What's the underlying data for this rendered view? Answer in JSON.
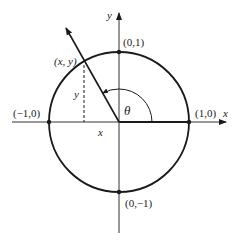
{
  "diagram": {
    "type": "unit-circle",
    "axes": {
      "x_label": "x",
      "y_label": "y"
    },
    "points": {
      "top": "(0,1)",
      "bottom": "(0,−1)",
      "left": "(−1,0)",
      "right": "(1,0)",
      "on_circle": "(x, y)"
    },
    "angle_label": "θ",
    "projection_labels": {
      "vertical": "y",
      "horizontal": "x"
    },
    "colors": {
      "stroke": "#1a1a1a",
      "axis": "#333333"
    }
  }
}
